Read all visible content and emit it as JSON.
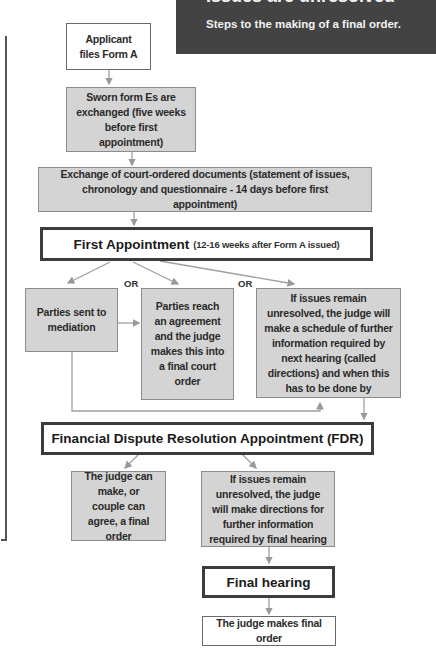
{
  "header": {
    "title": "Issues are unresolved",
    "subtitle": "Steps to the making of a final order."
  },
  "colors": {
    "header_bg": "#434343",
    "gray_fill": "#d4d4d4",
    "connector": "#999999",
    "heavy_border": "#3c3c3c"
  },
  "flow": {
    "applicant": "Applicant files Form A",
    "sworn_forms": "Sworn form Es are exchanged (five weeks before first appointment)",
    "exchange_docs": "Exchange of court-ordered documents (statement of issues, chronology and questionnaire - 14 days before first appointment)",
    "first_appointment": {
      "title": "First Appointment",
      "note": "(12-16 weeks after Form A issued)"
    },
    "or_label": "OR",
    "options": [
      "Parties sent to mediation",
      "Parties reach an agreement and the judge makes this into a final court order",
      "If issues remain unresolved, the judge will make a schedule of further information required by next hearing (called directions) and when this has to be done by"
    ],
    "fdr": {
      "title": "Financial Dispute Resolution Appointment (FDR)"
    },
    "fdr_options": [
      "The judge can make, or couple can agree, a final order",
      "If issues remain unresolved, the judge will make directions for further information required by final hearing"
    ],
    "final_hearing": {
      "title": "Final hearing"
    },
    "final_order": "The judge makes final order"
  }
}
